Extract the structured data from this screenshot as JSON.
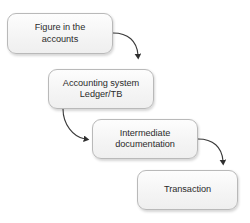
{
  "diagram": {
    "background_color": "#ffffff",
    "node_fill_color": "#f4f4f4",
    "node_border_color": "#b9b9b9",
    "text_color": "#2b2b2b",
    "connector_color": "#333333",
    "nodes": [
      {
        "id": "figure-in-the-accounts",
        "label": "Figure in the\naccounts"
      },
      {
        "id": "accounting-system",
        "label": "Accounting system\nLedger/TB"
      },
      {
        "id": "intermediate-documentation",
        "label": "Intermediate\ndocumentation"
      },
      {
        "id": "transaction",
        "label": "Transaction"
      }
    ],
    "connectors": [
      {
        "id": "figure-to-accounting-system",
        "from": "figure-in-the-accounts",
        "to": "accounting-system",
        "arrow": "down"
      },
      {
        "id": "accounting-system-to-intermediate",
        "from": "accounting-system",
        "to": "intermediate-documentation",
        "arrow": "right"
      },
      {
        "id": "intermediate-to-transaction",
        "from": "intermediate-documentation",
        "to": "transaction",
        "arrow": "down"
      }
    ]
  }
}
